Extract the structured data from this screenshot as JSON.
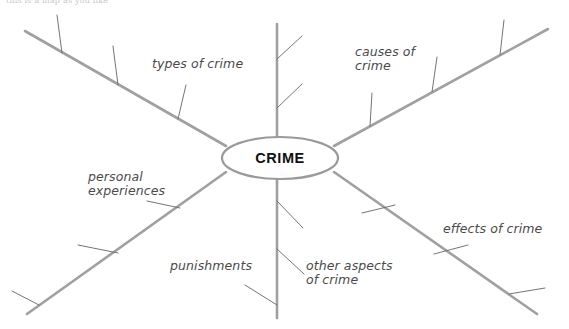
{
  "page": {
    "caption": "this is a map as you like",
    "background_color": "#ffffff"
  },
  "diagram": {
    "type": "mind-map",
    "center": {
      "label": "CRIME",
      "cx": 280,
      "cy": 158,
      "rx": 58,
      "ry": 21,
      "stroke_color": "#9a9a9a",
      "fill_color": "#ffffff"
    },
    "style": {
      "branch_color": "#a0a0a0",
      "branch_width": 2.6,
      "tick_color": "#757575",
      "tick_width": 1.0
    },
    "branches": [
      {
        "id": "types-of-crime",
        "label": "types of crime",
        "label_x": 152,
        "label_y": 57,
        "direction": "upper-left",
        "x1": 226,
        "y1": 146,
        "x2": 25,
        "y2": 31,
        "ticks": [
          {
            "x1": 178,
            "y1": 119,
            "x2": 186,
            "y2": 85
          },
          {
            "x1": 118,
            "y1": 85,
            "x2": 113,
            "y2": 46
          },
          {
            "x1": 62,
            "y1": 53,
            "x2": 57,
            "y2": 15
          }
        ]
      },
      {
        "id": "causes-of-crime",
        "label": "causes of\ncrime",
        "label_x": 355,
        "label_y": 45,
        "direction": "upper-right",
        "x1": 334,
        "y1": 146,
        "x2": 548,
        "y2": 29,
        "ticks": [
          {
            "x1": 370,
            "y1": 126,
            "x2": 372,
            "y2": 93
          },
          {
            "x1": 432,
            "y1": 92,
            "x2": 437,
            "y2": 57
          },
          {
            "x1": 500,
            "y1": 55,
            "x2": 504,
            "y2": 20
          }
        ]
      },
      {
        "id": "upper-vertical",
        "label": "",
        "label_x": 0,
        "label_y": 0,
        "direction": "up",
        "x1": 277,
        "y1": 139,
        "x2": 277,
        "y2": 24,
        "ticks": [
          {
            "x1": 277,
            "y1": 108,
            "x2": 302,
            "y2": 84
          },
          {
            "x1": 277,
            "y1": 59,
            "x2": 302,
            "y2": 36
          }
        ]
      },
      {
        "id": "personal-experiences",
        "label": "personal\nexperiences",
        "label_x": 88,
        "label_y": 170,
        "direction": "lower-left",
        "x1": 226,
        "y1": 172,
        "x2": 27,
        "y2": 314,
        "ticks": [
          {
            "x1": 180,
            "y1": 208,
            "x2": 147,
            "y2": 201
          },
          {
            "x1": 118,
            "y1": 253,
            "x2": 78,
            "y2": 245
          },
          {
            "x1": 39,
            "y1": 305,
            "x2": 12,
            "y2": 291
          }
        ]
      },
      {
        "id": "effects-of-crime",
        "label": "effects of crime",
        "label_x": 443,
        "label_y": 222,
        "direction": "lower-right",
        "x1": 334,
        "y1": 172,
        "x2": 537,
        "y2": 314,
        "ticks": [
          {
            "x1": 362,
            "y1": 213,
            "x2": 395,
            "y2": 205
          },
          {
            "x1": 434,
            "y1": 254,
            "x2": 468,
            "y2": 245
          },
          {
            "x1": 509,
            "y1": 294,
            "x2": 545,
            "y2": 288
          }
        ]
      },
      {
        "id": "punishments-other-aspects",
        "label": "punishments",
        "label_x": 170,
        "label_y": 259,
        "direction": "down",
        "x1": 277,
        "y1": 178,
        "x2": 277,
        "y2": 318,
        "ticks": [
          {
            "x1": 277,
            "y1": 201,
            "x2": 303,
            "y2": 228
          },
          {
            "x1": 277,
            "y1": 249,
            "x2": 304,
            "y2": 274
          },
          {
            "x1": 277,
            "y1": 305,
            "x2": 245,
            "y2": 285
          }
        ]
      },
      {
        "id": "other-aspects-of-crime",
        "label": "other aspects\nof crime",
        "label_x": 306,
        "label_y": 259,
        "direction": "down-right-text",
        "x1": 0,
        "y1": 0,
        "x2": 0,
        "y2": 0,
        "ticks": []
      }
    ]
  }
}
